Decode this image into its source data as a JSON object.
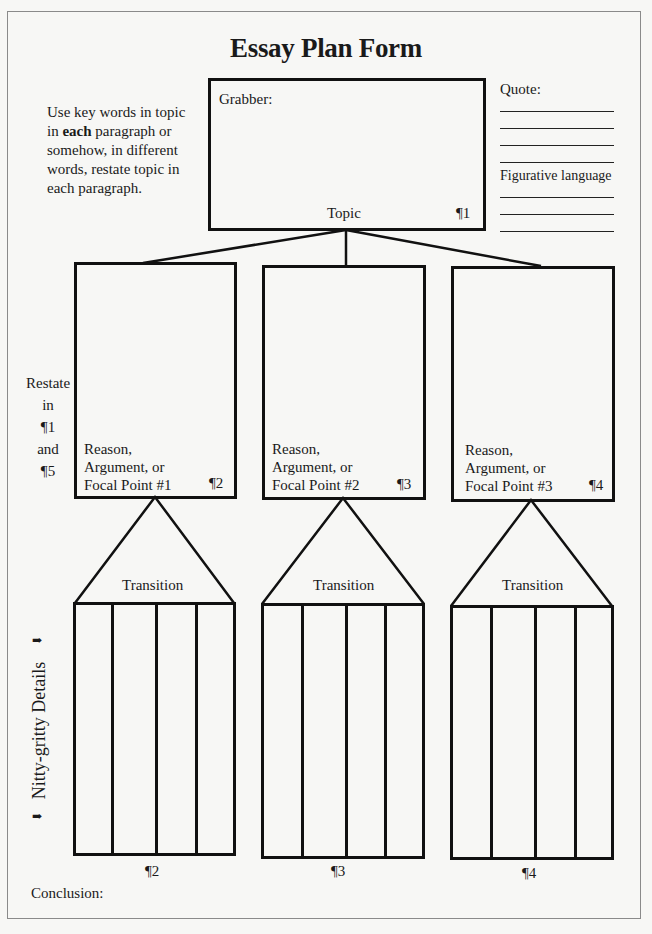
{
  "title": "Essay Plan Form",
  "instructions": {
    "line1": "Use key words in topic",
    "line2_pre": "in ",
    "line2_bold": "each",
    "line2_post": " paragraph or",
    "line3": "somehow, in different",
    "line4": "words, restate topic in",
    "line5": "each paragraph."
  },
  "topic_box": {
    "grabber_label": "Grabber:",
    "topic_label": "Topic",
    "paragraph_mark": "¶1"
  },
  "side_panel": {
    "quote_label": "Quote:",
    "quote_line_count": 4,
    "figurative_label": "Figurative language",
    "figurative_line_count": 3
  },
  "restate_note": {
    "lines": [
      "Restate",
      "in",
      "¶1",
      "and",
      "¶5"
    ]
  },
  "body_boxes": [
    {
      "line1": "Reason,",
      "line2": "Argument, or",
      "line3": "Focal Point #1",
      "paragraph_mark": "¶2"
    },
    {
      "line1": "Reason,",
      "line2": "Argument, or",
      "line3": "Focal Point #2",
      "paragraph_mark": "¶3"
    },
    {
      "line1": "Reason,",
      "line2": "Argument, or",
      "line3": "Focal Point #3",
      "paragraph_mark": "¶4"
    }
  ],
  "transitions": [
    {
      "label": "Transition"
    },
    {
      "label": "Transition"
    },
    {
      "label": "Transition"
    }
  ],
  "details": {
    "side_label": "Nitty-gritty Details",
    "arrow_glyph": "➡",
    "columns_per_group": 4,
    "group_marks": [
      "¶2",
      "¶3",
      "¶4"
    ]
  },
  "conclusion_label": "Conclusion:"
}
